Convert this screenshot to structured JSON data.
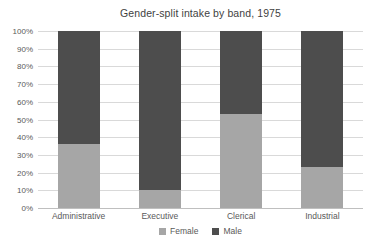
{
  "chart_data": {
    "type": "bar",
    "variant": "stacked-100",
    "title": "Gender-split intake by band, 1975",
    "categories": [
      "Administrative",
      "Executive",
      "Clerical",
      "Industrial"
    ],
    "series": [
      {
        "name": "Female",
        "color": "#a6a6a6",
        "values": [
          36,
          10,
          53,
          23
        ]
      },
      {
        "name": "Male",
        "color": "#4d4d4d",
        "values": [
          64,
          90,
          47,
          77
        ]
      }
    ],
    "xlabel": "",
    "ylabel": "",
    "ylim": [
      0,
      100
    ],
    "ytick_step": 10,
    "ytick_labels": [
      "0%",
      "10%",
      "20%",
      "30%",
      "40%",
      "50%",
      "60%",
      "70%",
      "80%",
      "90%",
      "100%"
    ],
    "grid": true,
    "legend_position": "bottom",
    "colors": {
      "gridline": "#d9d9d9",
      "axis_line": "#bfbfbf",
      "axis_text": "#595959",
      "title_text": "#3f3f3f",
      "background": "#ffffff"
    }
  }
}
